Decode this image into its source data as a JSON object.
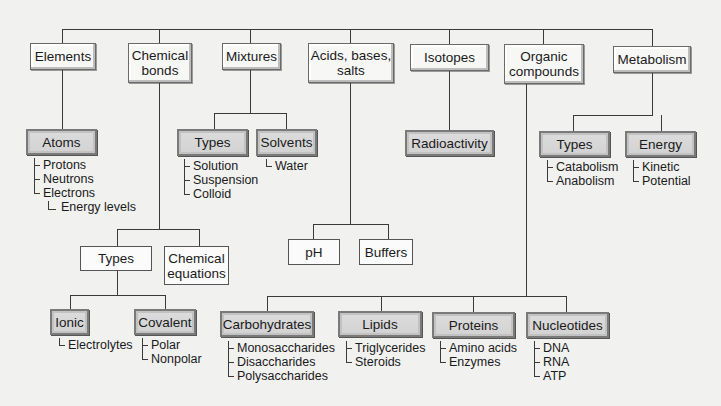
{
  "top_nodes": [
    {
      "label": "Elements"
    },
    {
      "label": "Chemical\nbonds"
    },
    {
      "label": "Mixtures"
    },
    {
      "label": "Acids, bases,\nsalts"
    },
    {
      "label": "Isotopes"
    },
    {
      "label": "Organic\ncompounds"
    },
    {
      "label": "Metabolism"
    }
  ],
  "elements": {
    "child": "Atoms",
    "items": [
      "Protons",
      "Neutrons",
      "Electrons"
    ],
    "nested": "Energy levels"
  },
  "chemical_bonds": {
    "children": [
      "Types",
      "Chemical\nequations"
    ],
    "types": [
      {
        "label": "Ionic",
        "items": [
          "Electrolytes"
        ]
      },
      {
        "label": "Covalent",
        "items": [
          "Polar",
          "Nonpolar"
        ]
      }
    ]
  },
  "mixtures": {
    "children": [
      {
        "label": "Types",
        "items": [
          "Solution",
          "Suspension",
          "Colloid"
        ]
      },
      {
        "label": "Solvents",
        "items": [
          "Water"
        ]
      }
    ]
  },
  "acids_bases_salts": {
    "children": [
      "pH",
      "Buffers"
    ]
  },
  "isotopes": {
    "child": "Radioactivity"
  },
  "organic_compounds": {
    "children": [
      {
        "label": "Carbohydrates",
        "items": [
          "Monosaccharides",
          "Disaccharides",
          "Polysaccharides"
        ]
      },
      {
        "label": "Lipids",
        "items": [
          "Triglycerides",
          "Steroids"
        ]
      },
      {
        "label": "Proteins",
        "items": [
          "Amino acids",
          "Enzymes"
        ]
      },
      {
        "label": "Nucleotides",
        "items": [
          "DNA",
          "RNA",
          "ATP"
        ]
      }
    ]
  },
  "metabolism": {
    "children": [
      {
        "label": "Types",
        "items": [
          "Catabolism",
          "Anabolism"
        ]
      },
      {
        "label": "Energy",
        "items": [
          "Kinetic",
          "Potential"
        ]
      }
    ]
  },
  "colors": {
    "background": "#f1f1f0",
    "line": "#3a3a3a",
    "level1_box": "#f7f7f6",
    "level2_box": "#d6d6d6"
  }
}
